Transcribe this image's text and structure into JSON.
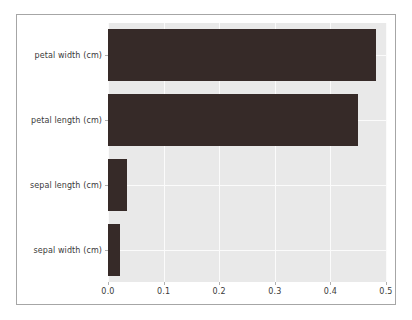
{
  "chart_data": {
    "type": "bar",
    "orientation": "horizontal",
    "title": "",
    "xlabel": "",
    "ylabel": "",
    "categories": [
      "sepal width (cm)",
      "sepal length (cm)",
      "petal length (cm)",
      "petal width (cm)"
    ],
    "values": [
      0.021,
      0.034,
      0.449,
      0.482
    ],
    "xlim": [
      0.0,
      0.5
    ],
    "xticks": [
      0.0,
      0.1,
      0.2,
      0.3,
      0.4,
      0.5
    ],
    "xticklabels": [
      "0.0",
      "0.1",
      "0.2",
      "0.3",
      "0.4",
      "0.5"
    ],
    "grid": true,
    "legend": null,
    "bar_color": "#362a28",
    "axes_facecolor": "#e9e9e9",
    "gridline_color": "#fbfbfb",
    "figure_facecolor": "#ffffff"
  }
}
